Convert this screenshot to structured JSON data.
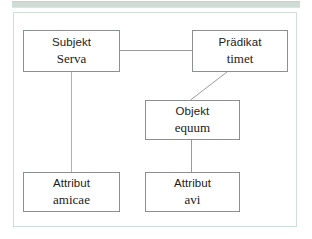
{
  "figure": {
    "type": "sentence-structure-diagram",
    "language_of_labels": "German",
    "language_of_examples": "Latin",
    "accent_band_color": "#cfdcd6",
    "frame_border_color": "#d2ded8",
    "node_border_color": "#8d8f8e",
    "connector_color": "#9a9a9a"
  },
  "nodes": [
    {
      "id": "subjekt",
      "role": "Subjekt",
      "word": "Serva"
    },
    {
      "id": "praedikat",
      "role": "Prädikat",
      "word": "timet"
    },
    {
      "id": "objekt",
      "role": "Objekt",
      "word": "equum"
    },
    {
      "id": "attr_left",
      "role": "Attribut",
      "word": "amicae"
    },
    {
      "id": "attr_right",
      "role": "Attribut",
      "word": "avi"
    }
  ],
  "connectors": [
    {
      "id": "subjekt-praedikat",
      "from": "subjekt",
      "to": "praedikat",
      "style": "horizontal"
    },
    {
      "id": "praedikat-objekt",
      "from": "praedikat",
      "to": "objekt",
      "style": "diagonal"
    },
    {
      "id": "subjekt-attribut",
      "from": "subjekt",
      "to": "attr_left",
      "style": "vertical"
    },
    {
      "id": "objekt-attribut",
      "from": "objekt",
      "to": "attr_right",
      "style": "vertical"
    }
  ]
}
